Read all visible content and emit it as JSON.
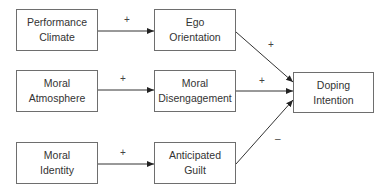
{
  "diagram": {
    "type": "path-model",
    "nodes": [
      {
        "id": "performance_climate",
        "lines": [
          "Performance",
          "Climate"
        ]
      },
      {
        "id": "ego_orientation",
        "lines": [
          "Ego",
          "Orientation"
        ]
      },
      {
        "id": "moral_atmosphere",
        "lines": [
          "Moral",
          "Atmosphere"
        ]
      },
      {
        "id": "moral_disengagement",
        "lines": [
          "Moral",
          "Disengagement"
        ]
      },
      {
        "id": "moral_identity",
        "lines": [
          "Moral",
          "Identity"
        ]
      },
      {
        "id": "anticipated_guilt",
        "lines": [
          "Anticipated",
          "Guilt"
        ]
      },
      {
        "id": "doping_intention",
        "lines": [
          "Doping",
          "Intention"
        ]
      }
    ],
    "edges": [
      {
        "from": "performance_climate",
        "to": "ego_orientation",
        "sign": "+"
      },
      {
        "from": "moral_atmosphere",
        "to": "moral_disengagement",
        "sign": "+"
      },
      {
        "from": "moral_identity",
        "to": "anticipated_guilt",
        "sign": "+"
      },
      {
        "from": "ego_orientation",
        "to": "doping_intention",
        "sign": "+"
      },
      {
        "from": "moral_disengagement",
        "to": "doping_intention",
        "sign": "+"
      },
      {
        "from": "anticipated_guilt",
        "to": "doping_intention",
        "sign": "–"
      }
    ]
  },
  "colors": {
    "line": "#333333",
    "border": "#6e6e6e",
    "text": "#333333"
  }
}
